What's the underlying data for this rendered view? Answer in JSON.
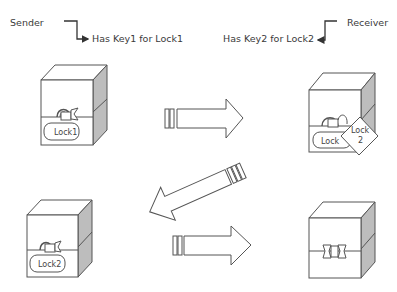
{
  "sender": {
    "role_label": "Sender",
    "key_label": "Has Key1 for Lock1"
  },
  "receiver": {
    "role_label": "Receiver",
    "key_label": "Has Key2 for Lock2"
  },
  "boxes": [
    {
      "position": "top-left",
      "locks": [
        "Lock1"
      ]
    },
    {
      "position": "top-right",
      "locks": [
        "Lock1",
        "Lock 2"
      ]
    },
    {
      "position": "bottom-left",
      "locks": [
        "Lock2"
      ]
    },
    {
      "position": "bottom-right",
      "locks": []
    }
  ],
  "lock_labels": {
    "lock1": "Lock1",
    "lock1_partial": "Lock",
    "lock2_line1": "Lock",
    "lock2_line2": "2",
    "lock2": "Lock2"
  },
  "arrows": [
    {
      "from": "sender",
      "to": "receiver",
      "step": 1
    },
    {
      "from": "receiver",
      "to": "sender",
      "step": 2
    },
    {
      "from": "sender",
      "to": "receiver",
      "step": 3
    }
  ],
  "colors": {
    "stroke": "#555555",
    "shade": "#bdbdbd",
    "background": "#ffffff"
  }
}
